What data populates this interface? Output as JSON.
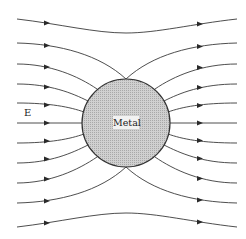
{
  "diagram": {
    "labels": {
      "field": "E",
      "object": "Metal"
    },
    "sphere": {
      "cx": 126,
      "cy": 123,
      "r": 44,
      "fill": "#c8c8c8",
      "stroke": "#333333"
    },
    "field_line_count": 11,
    "line_color": "#3a3a3a"
  }
}
